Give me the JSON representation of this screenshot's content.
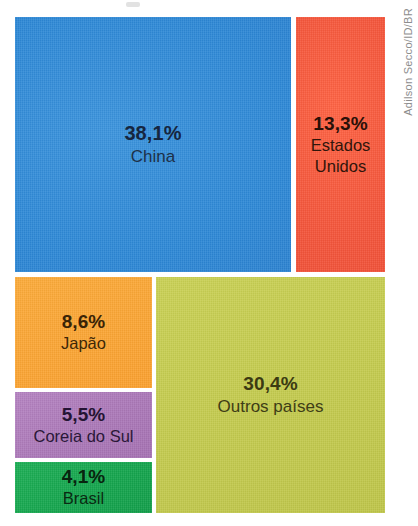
{
  "credit": {
    "text": "Adilson Secco/ID/BR"
  },
  "chart_data": {
    "type": "treemap",
    "title": "",
    "subtitle": "",
    "xlabel": "",
    "ylabel": "",
    "grid": false,
    "legend_position": "none",
    "value_unit": "%",
    "value_format": "comma-decimal",
    "total": 100.0,
    "categories": [
      "China",
      "Estados Unidos",
      "Outros países",
      "Japão",
      "Coreia do Sul",
      "Brasil"
    ],
    "values": [
      38.1,
      13.3,
      30.4,
      8.6,
      5.5,
      4.1
    ],
    "labels": [
      "38,1%",
      "13,3%",
      "30,4%",
      "8,6%",
      "5,5%",
      "4,1%"
    ],
    "colors": [
      "#2d88d6",
      "#f4543a",
      "#c4cb4e",
      "#fba534",
      "#ab78b8",
      "#14a54d"
    ],
    "tiles": [
      {
        "id": "china",
        "name": "China",
        "name_lines": [
          "China"
        ],
        "value": 38.1,
        "label": "38,1%",
        "color": "#2d88d6",
        "text_color": "#16263f"
      },
      {
        "id": "estados-unidos",
        "name": "Estados Unidos",
        "name_lines": [
          "Estados",
          "Unidos"
        ],
        "value": 13.3,
        "label": "13,3%",
        "color": "#f4543a",
        "text_color": "#2a1008"
      },
      {
        "id": "japao",
        "name": "Japão",
        "name_lines": [
          "Japão"
        ],
        "value": 8.6,
        "label": "8,6%",
        "color": "#fba534",
        "text_color": "#3a2406"
      },
      {
        "id": "coreia-do-sul",
        "name": "Coreia do Sul",
        "name_lines": [
          "Coreia do Sul"
        ],
        "value": 5.5,
        "label": "5,5%",
        "color": "#ab78b8",
        "text_color": "#241433"
      },
      {
        "id": "brasil",
        "name": "Brasil",
        "name_lines": [
          "Brasil"
        ],
        "value": 4.1,
        "label": "4,1%",
        "color": "#14a54d",
        "text_color": "#08240f"
      },
      {
        "id": "outros-paises",
        "name": "Outros países",
        "name_lines": [
          "Outros países"
        ],
        "value": 30.4,
        "label": "30,4%",
        "color": "#c4cb4e",
        "text_color": "#3b3a12"
      }
    ]
  }
}
